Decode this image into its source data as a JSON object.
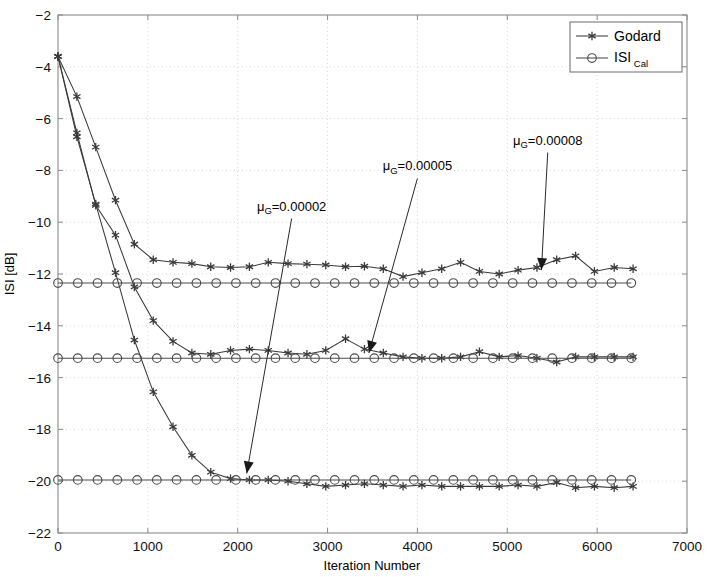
{
  "chart_data": {
    "type": "line",
    "title": "",
    "xlabel": "Iteration Number",
    "ylabel": "ISI [dB]",
    "xlim": [
      0,
      7000
    ],
    "ylim": [
      -22,
      -2
    ],
    "xticks": [
      0,
      1000,
      2000,
      3000,
      4000,
      5000,
      6000,
      7000
    ],
    "yticks": [
      -2,
      -4,
      -6,
      -8,
      -10,
      -12,
      -14,
      -16,
      -18,
      -20,
      -22
    ],
    "grid": true,
    "legend_position": "top-right",
    "legend": [
      "Godard",
      "ISI Cal"
    ],
    "annotations": [
      {
        "text": "μ_G=0.00002",
        "mu": "μ",
        "sub": "G",
        "value": "=0.00002",
        "text_x": 2600,
        "text_y": -9.55,
        "arrow_to_x": 2100,
        "arrow_to_y": -19.7
      },
      {
        "text": "μ_G=0.00005",
        "mu": "μ",
        "sub": "G",
        "value": "=0.00005",
        "text_x": 4000,
        "text_y": -8.0,
        "arrow_to_x": 3460,
        "arrow_to_y": -15.05
      },
      {
        "text": "μ_G=0.00008",
        "mu": "μ",
        "sub": "G",
        "value": "=0.00008",
        "text_x": 5450,
        "text_y": -7.0,
        "arrow_to_x": 5380,
        "arrow_to_y": -11.85
      }
    ],
    "series": [
      {
        "name": "Godard mu=0.00008",
        "marker": "asterisk",
        "color": "#3a3a3a",
        "x": [
          0,
          210,
          420,
          640,
          850,
          1060,
          1280,
          1490,
          1700,
          1920,
          2130,
          2340,
          2560,
          2770,
          2980,
          3200,
          3410,
          3620,
          3840,
          4050,
          4270,
          4480,
          4690,
          4910,
          5120,
          5330,
          5550,
          5760,
          5970,
          6190,
          6400
        ],
        "y": [
          -3.6,
          -5.15,
          -7.1,
          -9.15,
          -10.85,
          -11.45,
          -11.55,
          -11.6,
          -11.72,
          -11.75,
          -11.72,
          -11.55,
          -11.6,
          -11.62,
          -11.65,
          -11.72,
          -11.7,
          -11.8,
          -12.1,
          -11.95,
          -11.8,
          -11.55,
          -11.9,
          -12.0,
          -11.85,
          -11.75,
          -11.45,
          -11.3,
          -11.9,
          -11.75,
          -11.8
        ]
      },
      {
        "name": "Godard mu=0.00005",
        "marker": "asterisk",
        "color": "#3a3a3a",
        "x": [
          0,
          210,
          420,
          640,
          850,
          1060,
          1280,
          1490,
          1700,
          1920,
          2130,
          2340,
          2560,
          2770,
          2980,
          3200,
          3410,
          3620,
          3840,
          4050,
          4270,
          4480,
          4690,
          4910,
          5120,
          5330,
          5550,
          5760,
          5970,
          6190,
          6400
        ],
        "y": [
          -3.6,
          -6.55,
          -9.35,
          -10.5,
          -12.5,
          -13.8,
          -14.6,
          -15.05,
          -15.1,
          -14.95,
          -14.9,
          -14.95,
          -15.05,
          -15.1,
          -14.95,
          -14.5,
          -14.9,
          -15.05,
          -15.2,
          -15.25,
          -15.25,
          -15.2,
          -15.0,
          -15.2,
          -15.15,
          -15.25,
          -15.4,
          -15.2,
          -15.2,
          -15.2,
          -15.2
        ]
      },
      {
        "name": "Godard mu=0.00002",
        "marker": "asterisk",
        "color": "#3a3a3a",
        "x": [
          0,
          210,
          420,
          640,
          850,
          1060,
          1280,
          1490,
          1700,
          1920,
          2130,
          2340,
          2560,
          2770,
          2980,
          3200,
          3410,
          3620,
          3840,
          4050,
          4270,
          4480,
          4690,
          4910,
          5120,
          5330,
          5550,
          5760,
          5970,
          6190,
          6400
        ],
        "y": [
          -3.6,
          -6.7,
          -9.3,
          -11.95,
          -14.55,
          -16.55,
          -17.9,
          -19.0,
          -19.65,
          -19.9,
          -19.95,
          -19.95,
          -20.0,
          -20.1,
          -20.2,
          -20.15,
          -20.1,
          -20.15,
          -20.2,
          -20.15,
          -20.2,
          -20.2,
          -20.2,
          -20.2,
          -20.15,
          -20.2,
          -20.05,
          -20.25,
          -20.2,
          -20.25,
          -20.2
        ]
      },
      {
        "name": "ISI Cal -12.35",
        "marker": "circle",
        "color": "#4a4a4a",
        "level": -12.35,
        "x": [
          0,
          220,
          440,
          660,
          880,
          1100,
          1320,
          1540,
          1760,
          1980,
          2200,
          2420,
          2640,
          2860,
          3080,
          3300,
          3520,
          3740,
          3960,
          4180,
          4400,
          4620,
          4840,
          5060,
          5280,
          5500,
          5720,
          5940,
          6160,
          6380
        ],
        "y": [
          -12.35,
          -12.35,
          -12.35,
          -12.35,
          -12.35,
          -12.35,
          -12.35,
          -12.35,
          -12.35,
          -12.35,
          -12.35,
          -12.35,
          -12.35,
          -12.35,
          -12.35,
          -12.35,
          -12.35,
          -12.35,
          -12.35,
          -12.35,
          -12.35,
          -12.35,
          -12.35,
          -12.35,
          -12.35,
          -12.35,
          -12.35,
          -12.35,
          -12.35,
          -12.35
        ]
      },
      {
        "name": "ISI Cal -15.25",
        "marker": "circle",
        "color": "#4a4a4a",
        "level": -15.25,
        "x": [
          0,
          220,
          440,
          660,
          880,
          1100,
          1320,
          1540,
          1760,
          1980,
          2200,
          2420,
          2640,
          2860,
          3080,
          3300,
          3520,
          3740,
          3960,
          4180,
          4400,
          4620,
          4840,
          5060,
          5280,
          5500,
          5720,
          5940,
          6160,
          6380
        ],
        "y": [
          -15.25,
          -15.25,
          -15.25,
          -15.25,
          -15.25,
          -15.25,
          -15.25,
          -15.25,
          -15.25,
          -15.25,
          -15.25,
          -15.25,
          -15.25,
          -15.25,
          -15.25,
          -15.25,
          -15.25,
          -15.25,
          -15.25,
          -15.25,
          -15.25,
          -15.25,
          -15.25,
          -15.25,
          -15.25,
          -15.25,
          -15.25,
          -15.25,
          -15.25,
          -15.25
        ]
      },
      {
        "name": "ISI Cal -19.95",
        "marker": "circle",
        "color": "#4a4a4a",
        "level": -19.95,
        "x": [
          0,
          220,
          440,
          660,
          880,
          1100,
          1320,
          1540,
          1760,
          1980,
          2200,
          2420,
          2640,
          2860,
          3080,
          3300,
          3520,
          3740,
          3960,
          4180,
          4400,
          4620,
          4840,
          5060,
          5280,
          5500,
          5720,
          5940,
          6160,
          6380
        ],
        "y": [
          -19.95,
          -19.95,
          -19.95,
          -19.95,
          -19.95,
          -19.95,
          -19.95,
          -19.95,
          -19.95,
          -19.95,
          -19.95,
          -19.95,
          -19.95,
          -19.95,
          -19.95,
          -19.95,
          -19.95,
          -19.95,
          -19.95,
          -19.95,
          -19.95,
          -19.95,
          -19.95,
          -19.95,
          -19.95,
          -19.95,
          -19.95,
          -19.95,
          -19.95,
          -19.95
        ]
      }
    ]
  },
  "legend": {
    "godard_label": "Godard",
    "isi_label": "ISI",
    "isi_sub": "Cal"
  },
  "axes": {
    "xlabel": "Iteration Number",
    "ylabel": "ISI [dB]"
  },
  "colors": {
    "axis": "#8a8a8a",
    "grid": "#d8d8d8",
    "curve": "#3a3a3a",
    "text": "#000000"
  }
}
